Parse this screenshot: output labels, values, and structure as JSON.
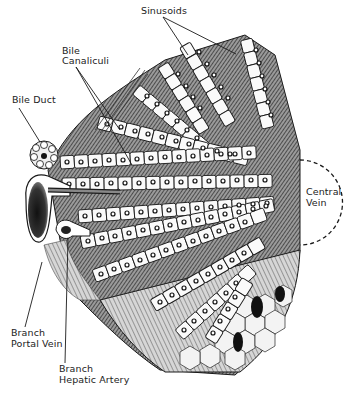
{
  "figure": {
    "labels": {
      "sinusoids": "Sinusoids",
      "bile_canaliculi_line1": "Bile",
      "bile_canaliculi_line2": "Canaliculi",
      "bile_duct": "Bile Duct",
      "central_vein_line1": "Central",
      "central_vein_line2": "Vein",
      "portal_vein_line1": "Branch",
      "portal_vein_line2": "Portal Vein",
      "hepatic_artery_line1": "Branch",
      "hepatic_artery_line2": "Hepatic Artery"
    },
    "colors": {
      "ink": "#1a1a1a",
      "paper": "#ffffff",
      "shade": "#555555",
      "cell_fill": "#f7f7f7"
    }
  }
}
